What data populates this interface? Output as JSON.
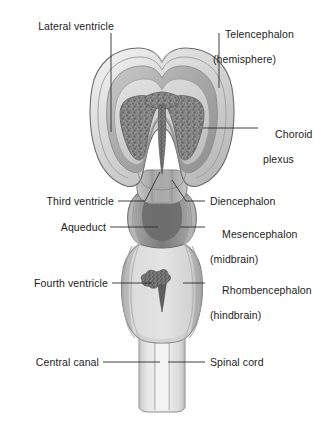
{
  "figure": {
    "labels": {
      "lateral_ventricle": "Lateral ventricle",
      "telencephalon_line1": "Telencephalon",
      "telencephalon_line2": "(hemisphere)",
      "choroid_plexus_line1": "Choroid",
      "choroid_plexus_line2": "plexus",
      "third_ventricle": "Third ventricle",
      "diencephalon": "Diencephalon",
      "aqueduct": "Aqueduct",
      "mesencephalon_line1": "Mesencephalon",
      "mesencephalon_line2": "(midbrain)",
      "fourth_ventricle": "Fourth ventricle",
      "rhombencephalon_line1": "Rhombencephalon",
      "rhombencephalon_line2": "(hindbrain)",
      "central_canal": "Central canal",
      "spinal_cord": "Spinal cord"
    },
    "colors": {
      "background": "#ffffff",
      "outline": "#6e6e6e",
      "leader_line": "#2a2a2a",
      "text": "#1c1c1c",
      "wall_outer": "#d8d8d8",
      "wall_mid": "#a9a9a9",
      "cavity_light": "#cfcfcf",
      "cavity_lighter": "#e2e2e2",
      "choroid_plexus": "#868686",
      "midbrain_dark": "#8a8a8a",
      "midbrain_core": "#6f6f6f",
      "hindbrain_body": "#d3d3d3",
      "hindbrain_edge": "#b0b0b0",
      "spinal_cord": "#e6e6e6",
      "spinal_edge": "#c2c2c2"
    }
  }
}
